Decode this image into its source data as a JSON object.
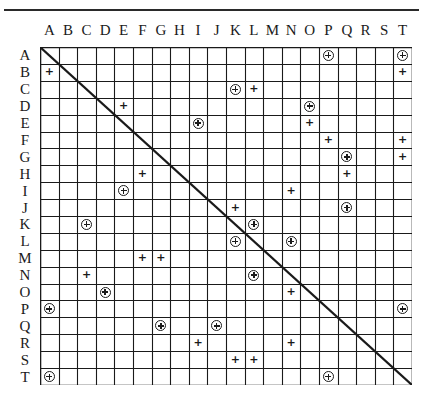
{
  "matrix": {
    "labels": [
      "A",
      "B",
      "C",
      "D",
      "E",
      "F",
      "G",
      "H",
      "I",
      "J",
      "K",
      "L",
      "M",
      "N",
      "O",
      "P",
      "Q",
      "R",
      "S",
      "T"
    ],
    "legend": {
      "plus": "+",
      "circled_plus": "⊕"
    },
    "diagonal": true,
    "entries": [
      {
        "row": "A",
        "col": "P",
        "mark": "circled_plus"
      },
      {
        "row": "A",
        "col": "T",
        "mark": "circled_plus"
      },
      {
        "row": "B",
        "col": "A",
        "mark": "plus"
      },
      {
        "row": "B",
        "col": "T",
        "mark": "plus"
      },
      {
        "row": "C",
        "col": "K",
        "mark": "circled_plus"
      },
      {
        "row": "C",
        "col": "L",
        "mark": "plus"
      },
      {
        "row": "D",
        "col": "E",
        "mark": "plus"
      },
      {
        "row": "D",
        "col": "O",
        "mark": "circled_plus"
      },
      {
        "row": "E",
        "col": "I",
        "mark": "circled_plus"
      },
      {
        "row": "E",
        "col": "O",
        "mark": "plus"
      },
      {
        "row": "F",
        "col": "P",
        "mark": "plus"
      },
      {
        "row": "F",
        "col": "T",
        "mark": "plus"
      },
      {
        "row": "G",
        "col": "Q",
        "mark": "circled_plus"
      },
      {
        "row": "G",
        "col": "T",
        "mark": "plus"
      },
      {
        "row": "H",
        "col": "F",
        "mark": "plus"
      },
      {
        "row": "H",
        "col": "Q",
        "mark": "plus"
      },
      {
        "row": "I",
        "col": "E",
        "mark": "circled_plus"
      },
      {
        "row": "I",
        "col": "N",
        "mark": "plus"
      },
      {
        "row": "J",
        "col": "K",
        "mark": "plus"
      },
      {
        "row": "J",
        "col": "Q",
        "mark": "circled_plus"
      },
      {
        "row": "K",
        "col": "C",
        "mark": "circled_plus"
      },
      {
        "row": "K",
        "col": "L",
        "mark": "circled_plus"
      },
      {
        "row": "L",
        "col": "K",
        "mark": "circled_plus"
      },
      {
        "row": "L",
        "col": "N",
        "mark": "circled_plus"
      },
      {
        "row": "M",
        "col": "F",
        "mark": "plus"
      },
      {
        "row": "M",
        "col": "G",
        "mark": "plus"
      },
      {
        "row": "N",
        "col": "C",
        "mark": "plus"
      },
      {
        "row": "N",
        "col": "L",
        "mark": "circled_plus"
      },
      {
        "row": "O",
        "col": "D",
        "mark": "circled_plus"
      },
      {
        "row": "O",
        "col": "N",
        "mark": "plus"
      },
      {
        "row": "P",
        "col": "A",
        "mark": "circled_plus"
      },
      {
        "row": "P",
        "col": "T",
        "mark": "circled_plus"
      },
      {
        "row": "Q",
        "col": "G",
        "mark": "circled_plus"
      },
      {
        "row": "Q",
        "col": "J",
        "mark": "circled_plus"
      },
      {
        "row": "R",
        "col": "I",
        "mark": "plus"
      },
      {
        "row": "R",
        "col": "N",
        "mark": "plus"
      },
      {
        "row": "S",
        "col": "K",
        "mark": "plus"
      },
      {
        "row": "S",
        "col": "L",
        "mark": "plus"
      },
      {
        "row": "T",
        "col": "A",
        "mark": "circled_plus"
      },
      {
        "row": "T",
        "col": "P",
        "mark": "circled_plus"
      }
    ]
  },
  "colors": {
    "ink": "#1a1a1a",
    "background": "#ffffff"
  }
}
